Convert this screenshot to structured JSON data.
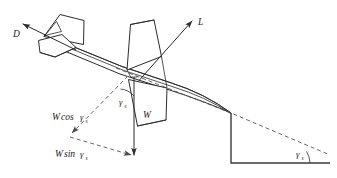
{
  "figure": {
    "name": "glide-force-diagram",
    "background_color": "#ffffff",
    "line_color": "#2b2b2b",
    "dashed_color": "#555555"
  },
  "labels": {
    "drag": {
      "symbol": "D",
      "name": "drag-force-label"
    },
    "lift": {
      "symbol": "L",
      "name": "lift-force-label"
    },
    "weight": {
      "symbol": "W",
      "name": "weight-force-label"
    },
    "weight_cos": {
      "symbol": "W",
      "operator": "cos",
      "angle": "γ",
      "subscript": "s",
      "name": "weight-cosine-component-label"
    },
    "weight_sin": {
      "symbol": "W",
      "operator": "sin",
      "angle": "γ",
      "subscript": "s",
      "name": "weight-sine-component-label"
    },
    "gamma_aircraft": {
      "symbol": "γ",
      "subscript": "s",
      "name": "flight-path-angle-at-aircraft-label"
    },
    "gamma_ground": {
      "symbol": "γ",
      "subscript": "s",
      "name": "flight-path-angle-at-ground-label"
    }
  },
  "vectors": [
    {
      "id": "drag",
      "label": "D",
      "style": "solid-arrow",
      "direction": "up-left"
    },
    {
      "id": "lift",
      "label": "L",
      "style": "solid-arrow",
      "direction": "up-right"
    },
    {
      "id": "weight",
      "label": "W",
      "style": "solid-arrow",
      "direction": "down"
    },
    {
      "id": "weight-cos",
      "label": "W cos γs",
      "style": "dashed-arrow",
      "direction": "down-left"
    },
    {
      "id": "weight-sin",
      "label": "W sin γs",
      "style": "dashed-arrow",
      "direction": "down-right"
    }
  ],
  "geometry": {
    "flight_path": "dashed",
    "ground_reference": "solid",
    "angle_marks": 2
  }
}
